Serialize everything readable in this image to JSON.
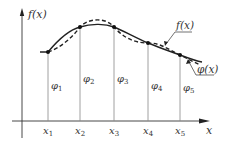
{
  "diagram": {
    "y_axis_label": "f(x)",
    "x_axis_label": "x",
    "curve_labels": {
      "f": "f(x)",
      "phi": "φ(x)"
    },
    "nodes": [
      {
        "x_label": "x",
        "x_sub": "1",
        "phi_label": "φ",
        "phi_sub": "1"
      },
      {
        "x_label": "x",
        "x_sub": "2",
        "phi_label": "φ",
        "phi_sub": "2"
      },
      {
        "x_label": "x",
        "x_sub": "3",
        "phi_label": "φ",
        "phi_sub": "3"
      },
      {
        "x_label": "x",
        "x_sub": "4",
        "phi_label": "φ",
        "phi_sub": "4"
      },
      {
        "x_label": "x",
        "x_sub": "5",
        "phi_label": "φ",
        "phi_sub": "5"
      }
    ],
    "colors": {
      "line": "#222222",
      "grid": "#888888",
      "text": "#333333"
    }
  }
}
